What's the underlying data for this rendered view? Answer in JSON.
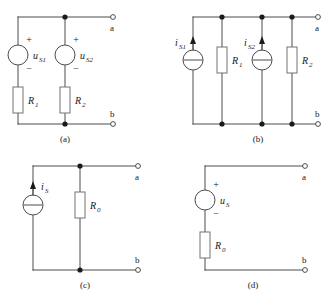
{
  "figure": {
    "kind": "circuit-diagram-sheet",
    "panel_count": 4,
    "colors": {
      "wire": "#4d4d4d",
      "node": "#1a1a1a",
      "resistor_border": "#737373",
      "background": "#ffffff",
      "text": "#1a1a1a"
    }
  },
  "panels": [
    {
      "id": "a",
      "caption": "(a)",
      "terminal_a": "a",
      "terminal_b": "b",
      "elements": [
        {
          "name": "voltage-source-1",
          "type": "voltage-source",
          "label": "u",
          "sub": "S1",
          "plus": "+",
          "minus": "−"
        },
        {
          "name": "voltage-source-2",
          "type": "voltage-source",
          "label": "u",
          "sub": "S2",
          "plus": "+",
          "minus": "−"
        },
        {
          "name": "resistor-1",
          "type": "resistor",
          "label": "R",
          "sub": "1"
        },
        {
          "name": "resistor-2",
          "type": "resistor",
          "label": "R",
          "sub": "2"
        }
      ]
    },
    {
      "id": "b",
      "caption": "(b)",
      "terminal_a": "a",
      "terminal_b": "b",
      "elements": [
        {
          "name": "current-source-1",
          "type": "current-source",
          "label": "i",
          "sub": "S1",
          "arrow": "up"
        },
        {
          "name": "resistor-1",
          "type": "resistor",
          "label": "R",
          "sub": "1"
        },
        {
          "name": "current-source-2",
          "type": "current-source",
          "label": "i",
          "sub": "S2",
          "arrow": "up"
        },
        {
          "name": "resistor-2",
          "type": "resistor",
          "label": "R",
          "sub": "2"
        }
      ]
    },
    {
      "id": "c",
      "caption": "(c)",
      "terminal_a": "a",
      "terminal_b": "b",
      "elements": [
        {
          "name": "current-source",
          "type": "current-source",
          "label": "i",
          "sub": "S",
          "arrow": "up"
        },
        {
          "name": "resistor-0",
          "type": "resistor",
          "label": "R",
          "sub": "0"
        }
      ]
    },
    {
      "id": "d",
      "caption": "(d)",
      "terminal_a": "a",
      "terminal_b": "b",
      "elements": [
        {
          "name": "voltage-source",
          "type": "voltage-source",
          "label": "u",
          "sub": "S",
          "plus": "+",
          "minus": "−"
        },
        {
          "name": "resistor-0",
          "type": "resistor",
          "label": "R",
          "sub": "0"
        }
      ]
    }
  ]
}
